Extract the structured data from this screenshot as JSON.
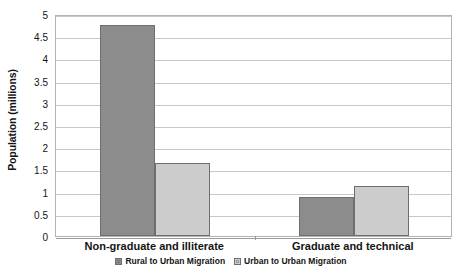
{
  "chart_data": {
    "type": "bar",
    "title": "",
    "xlabel": "",
    "ylabel": "Population (millions)",
    "categories": [
      "Non-graduate and illiterate",
      "Graduate and technical"
    ],
    "series": [
      {
        "name": "Rural to Urban Migration",
        "color": "#8c8c8c",
        "values": [
          4.75,
          0.88
        ]
      },
      {
        "name": "Urban to Urban Migration",
        "color": "#cccccc",
        "values": [
          1.65,
          1.12
        ]
      }
    ],
    "ylim": [
      0,
      5
    ],
    "ytick_step": 0.5,
    "yticks": [
      "0",
      "0.5",
      "1",
      "1.5",
      "2",
      "2.5",
      "3",
      "3.5",
      "4",
      "4.5",
      "5"
    ],
    "grid": true,
    "legend_position": "bottom",
    "plot_border_color": "#b3b3b3",
    "gridline_color": "#c8c8c8",
    "bar_border_color": "#6e6e6e",
    "background": "#ffffff"
  },
  "axis": {
    "y_title": "Population (millions)"
  },
  "legend": {
    "entries": [
      {
        "label": "Rural to Urban Migration",
        "swatch_icon": "legend-swatch-icon"
      },
      {
        "label": "Urban to Urban Migration",
        "swatch_icon": "legend-swatch-icon"
      }
    ]
  }
}
